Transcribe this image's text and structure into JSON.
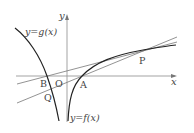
{
  "diagram": {
    "axes": {
      "x_label": "x",
      "y_label": "y",
      "origin_label": "O"
    },
    "curves": {
      "f_label": "y=f(x)",
      "g_label": "y=g(x)"
    },
    "points": {
      "A": "A",
      "B": "B",
      "P": "P",
      "Q": "Q"
    },
    "colors": {
      "axis": "#999999",
      "curve": "#222222",
      "line": "#777777",
      "text": "#444444"
    }
  }
}
